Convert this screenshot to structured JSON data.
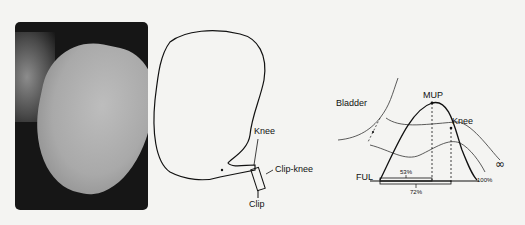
{
  "figure": {
    "panel_a": {
      "type": "photograph",
      "description": "radiograph of contrast-filled bladder"
    },
    "panel_b": {
      "labels": {
        "knee": "Knee",
        "clip_knee": "Clip-knee",
        "clip": "Clip"
      }
    },
    "panel_c": {
      "labels": {
        "bladder": "Bladder",
        "mup": "MUP",
        "knee": "Knee",
        "ful": "FUL",
        "pct_53": "53%",
        "pct_72": "72%",
        "pct_100": "100%"
      }
    }
  }
}
